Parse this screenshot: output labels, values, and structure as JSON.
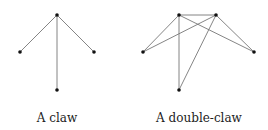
{
  "figures": [
    {
      "caption": "A claw",
      "nodes": {
        "top": [
          57,
          15
        ],
        "left": [
          20,
          52
        ],
        "right": [
          94,
          52
        ],
        "bottom": [
          57,
          90
        ]
      },
      "edges": [
        [
          "top",
          "left"
        ],
        [
          "top",
          "right"
        ],
        [
          "top",
          "bottom"
        ]
      ]
    },
    {
      "caption": "A double-claw",
      "nodes": {
        "top_left": [
          179,
          15
        ],
        "top_right": [
          216,
          15
        ],
        "left": [
          143,
          52
        ],
        "right": [
          254,
          52
        ],
        "bottom": [
          179,
          90
        ]
      },
      "edges": [
        [
          "top_left",
          "top_right"
        ],
        [
          "top_left",
          "left"
        ],
        [
          "top_left",
          "right"
        ],
        [
          "top_left",
          "bottom"
        ],
        [
          "top_right",
          "left"
        ],
        [
          "top_right",
          "right"
        ],
        [
          "top_right",
          "bottom"
        ]
      ]
    }
  ],
  "colors": {
    "edge": "#777777",
    "node": "#111111"
  }
}
